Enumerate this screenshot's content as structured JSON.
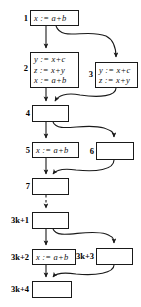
{
  "figure": {
    "kind": "control-flow-graph",
    "background_color": "#ffffff",
    "line_color": "#1a1a1a",
    "text_color": "#111111"
  },
  "nodes": [
    {
      "id": "n1",
      "label": "1",
      "statements": [
        "x := a+b"
      ],
      "box": {
        "left": 30,
        "top": 10,
        "width": 49,
        "height": 16
      },
      "label_pos": {
        "left": 16,
        "top": 14,
        "width": 12
      }
    },
    {
      "id": "n2",
      "label": "2",
      "statements": [
        "y := x+c",
        "z := x+y",
        "x := a+b"
      ],
      "box": {
        "left": 30,
        "top": 52,
        "width": 49,
        "height": 36
      },
      "label_pos": {
        "left": 16,
        "top": 64,
        "width": 12
      }
    },
    {
      "id": "n3",
      "label": "3",
      "statements": [
        "y := x+c",
        "z := x+y"
      ],
      "box": {
        "left": 95,
        "top": 62,
        "width": 43,
        "height": 26
      },
      "label_pos": {
        "left": 81,
        "top": 68,
        "width": 12
      }
    },
    {
      "id": "n4",
      "label": "4",
      "statements": [],
      "box": {
        "left": 32,
        "top": 105,
        "width": 37,
        "height": 17
      },
      "label_pos": {
        "left": 18,
        "top": 108,
        "width": 12
      }
    },
    {
      "id": "n5",
      "label": "5",
      "statements": [
        "x := a+b"
      ],
      "box": {
        "left": 32,
        "top": 142,
        "width": 47,
        "height": 16
      },
      "label_pos": {
        "left": 18,
        "top": 145,
        "width": 12
      }
    },
    {
      "id": "n6",
      "label": "6",
      "statements": [],
      "box": {
        "left": 96,
        "top": 142,
        "width": 38,
        "height": 18
      },
      "label_pos": {
        "left": 82,
        "top": 146,
        "width": 12
      }
    },
    {
      "id": "n7",
      "label": "7",
      "statements": [],
      "box": {
        "left": 32,
        "top": 178,
        "width": 37,
        "height": 17
      },
      "label_pos": {
        "left": 18,
        "top": 181,
        "width": 12
      }
    },
    {
      "id": "n3k1",
      "label": "3k+1",
      "statements": [],
      "box": {
        "left": 32,
        "top": 212,
        "width": 37,
        "height": 17
      },
      "label_pos": {
        "left": 3,
        "top": 216,
        "width": 27
      }
    },
    {
      "id": "n3k2",
      "label": "3k+2",
      "statements": [
        "x := a+b"
      ],
      "box": {
        "left": 32,
        "top": 249,
        "width": 44,
        "height": 16
      },
      "label_pos": {
        "left": 3,
        "top": 252,
        "width": 27
      }
    },
    {
      "id": "n3k3",
      "label": "3k+3",
      "statements": [],
      "box": {
        "left": 96,
        "top": 248,
        "width": 37,
        "height": 17
      },
      "label_pos": {
        "left": 76,
        "top": 252,
        "width": 19
      }
    },
    {
      "id": "n3k4",
      "label": "3k+4",
      "statements": [],
      "box": {
        "left": 32,
        "top": 281,
        "width": 40,
        "height": 17
      },
      "label_pos": {
        "left": 3,
        "top": 285,
        "width": 27
      }
    }
  ],
  "edges": [
    {
      "id": "e1-2",
      "from": "1",
      "to": "2",
      "style": "solid-straight"
    },
    {
      "id": "e1-3",
      "from": "1",
      "to": "3",
      "style": "solid-curved"
    },
    {
      "id": "e2-4",
      "from": "2",
      "to": "4",
      "style": "solid-straight"
    },
    {
      "id": "e3-4",
      "from": "3",
      "to": "4",
      "style": "solid-curved"
    },
    {
      "id": "e4-5",
      "from": "4",
      "to": "5",
      "style": "solid-straight"
    },
    {
      "id": "e4-6",
      "from": "4",
      "to": "6",
      "style": "solid-curved"
    },
    {
      "id": "e5-7",
      "from": "5",
      "to": "7",
      "style": "solid-straight"
    },
    {
      "id": "e6-7",
      "from": "6",
      "to": "7",
      "style": "solid-curved"
    },
    {
      "id": "e7-3k1",
      "from": "7",
      "to": "3k+1",
      "style": "dashed-straight"
    },
    {
      "id": "e3k1-3k2",
      "from": "3k+1",
      "to": "3k+2",
      "style": "solid-straight"
    },
    {
      "id": "e3k1-3k3",
      "from": "3k+1",
      "to": "3k+3",
      "style": "solid-curved"
    },
    {
      "id": "e3k2-3k4",
      "from": "3k+2",
      "to": "3k+4",
      "style": "solid-straight"
    },
    {
      "id": "e3k3-3k4",
      "from": "3k+3",
      "to": "3k+4",
      "style": "solid-curved"
    }
  ]
}
